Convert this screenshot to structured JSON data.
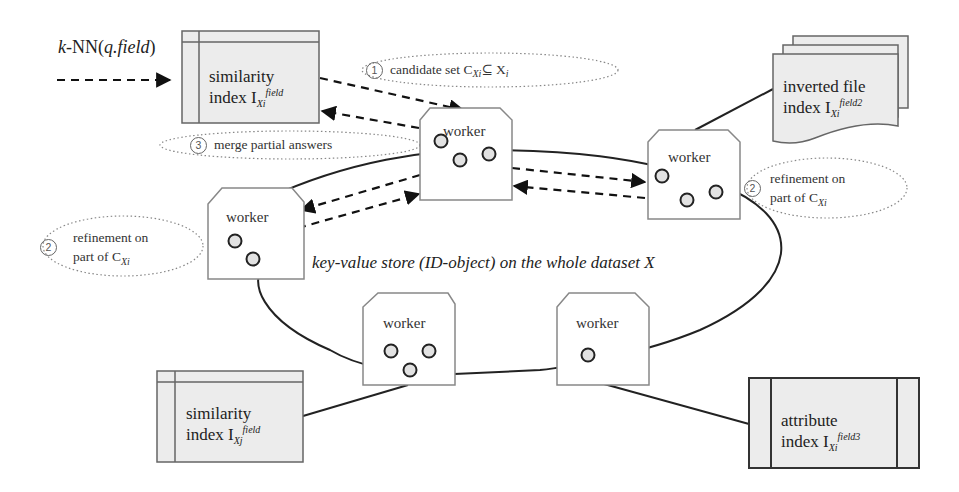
{
  "query": {
    "label_prefix": "k",
    "label_main": "-NN(",
    "label_arg": "q.field",
    "label_close": ")"
  },
  "boxes": {
    "similarity_top": {
      "line1": "similarity",
      "line2": "index I",
      "sub": "Xi",
      "sup": "field"
    },
    "inverted": {
      "line1": "inverted file",
      "line2": "index I",
      "sub": "Xi",
      "sup": "field2"
    },
    "similarity_bottom": {
      "line1": "similarity",
      "line2": "index I",
      "sub": "Xj",
      "sup": "field"
    },
    "attribute": {
      "line1": "attribute",
      "line2": "index I",
      "sub": "Xi",
      "sup": "field3"
    }
  },
  "workers": [
    {
      "label": "worker",
      "objects": 3
    },
    {
      "label": "worker",
      "objects": 3
    },
    {
      "label": "worker",
      "objects": 2
    },
    {
      "label": "worker",
      "objects": 3
    },
    {
      "label": "worker",
      "objects": 1
    }
  ],
  "notes": {
    "step1": {
      "num": "1",
      "text": "candidate set C",
      "sub": "Xi",
      "rel": "⊆ X",
      "rel_sub": "i"
    },
    "step3": {
      "num": "3",
      "text": "merge partial answers"
    },
    "step2_right": {
      "num": "2",
      "line1": "refinement on",
      "line2": "part of C",
      "sub": "Xi"
    },
    "step2_left": {
      "num": "2",
      "line1": "refinement on",
      "line2": "part of C",
      "sub": "Xi"
    }
  },
  "ring_label": "key-value store (ID-object) on the whole dataset X",
  "colors": {
    "box_fill": "#ececec",
    "stroke": "#555555",
    "line": "#222222",
    "object_fill": "#e2e2e2"
  }
}
